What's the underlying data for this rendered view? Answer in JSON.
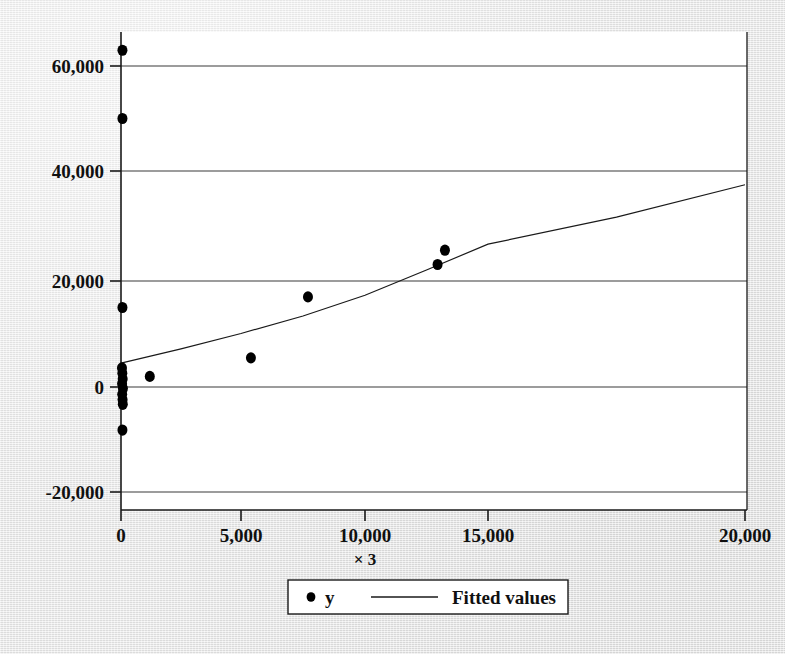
{
  "chart_data": {
    "type": "scatter",
    "title": "",
    "xlabel": "× 3",
    "ylabel": "",
    "xlim": [
      0,
      20000
    ],
    "ylim": [
      -20000,
      60000
    ],
    "grid": true,
    "x_ticks": [
      0,
      5000,
      10000,
      15000,
      20000
    ],
    "x_tick_labels": [
      "0",
      "5,000",
      "10,000",
      "15,000",
      "20,000"
    ],
    "y_ticks": [
      -20000,
      0,
      20000,
      40000,
      60000
    ],
    "y_tick_labels": [
      "-20,000",
      "0",
      "20,000",
      "40,000",
      "60,000"
    ],
    "legend_position": "bottom-center",
    "series": [
      {
        "name": "y",
        "type": "scatter",
        "marker": "filled-circle",
        "color": "#000000",
        "points": [
          {
            "x": 60,
            "y": 63000
          },
          {
            "x": 60,
            "y": 50000
          },
          {
            "x": 60,
            "y": 15000
          },
          {
            "x": 40,
            "y": 3600
          },
          {
            "x": 55,
            "y": 2600
          },
          {
            "x": 70,
            "y": 1500
          },
          {
            "x": 45,
            "y": 600
          },
          {
            "x": 80,
            "y": -300
          },
          {
            "x": 50,
            "y": -1400
          },
          {
            "x": 65,
            "y": -2400
          },
          {
            "x": 75,
            "y": -3300
          },
          {
            "x": 60,
            "y": -8200
          },
          {
            "x": 1200,
            "y": 2000
          },
          {
            "x": 5400,
            "y": 5500
          },
          {
            "x": 7700,
            "y": 17000
          },
          {
            "x": 12950,
            "y": 23000
          },
          {
            "x": 13250,
            "y": 25600
          }
        ]
      },
      {
        "name": "Fitted values",
        "type": "line",
        "color": "#1a1a1a",
        "points": [
          {
            "x": 0,
            "y": 4500
          },
          {
            "x": 2500,
            "y": 7200
          },
          {
            "x": 5000,
            "y": 10100
          },
          {
            "x": 7500,
            "y": 13400
          },
          {
            "x": 10000,
            "y": 17300
          },
          {
            "x": 12500,
            "y": 22000
          },
          {
            "x": 15000,
            "y": 26700
          },
          {
            "x": 17500,
            "y": 31600
          },
          {
            "x": 20000,
            "y": 37500
          }
        ]
      }
    ]
  },
  "legend": {
    "marker_series_label": "y",
    "line_series_label": "Fitted values"
  },
  "axes": {
    "x_axis_title": "× 3"
  },
  "colors": {
    "background": "#e8e8e8",
    "plot_background": "#ffffff",
    "ink": "#000000",
    "gridline": "#3a3a3a"
  }
}
